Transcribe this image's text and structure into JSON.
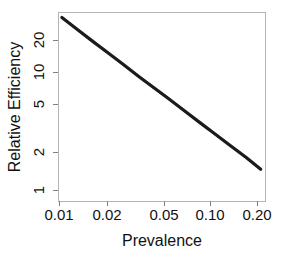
{
  "chart_data": {
    "type": "line",
    "title": "",
    "xlabel": "Prevalence",
    "ylabel": "Relative Efficiency",
    "xscale": "log",
    "yscale": "log",
    "xlim": [
      0.0095,
      0.215
    ],
    "ylim": [
      0.95,
      28
    ],
    "grid": false,
    "legend": "none",
    "xticks": [
      0.01,
      0.02,
      0.05,
      0.1,
      0.2
    ],
    "xticklabels": [
      "0.01",
      "0.02",
      "0.05",
      "0.10",
      "0.20"
    ],
    "yticks": [
      1,
      2,
      5,
      10,
      20
    ],
    "yticklabels": [
      "1",
      "2",
      "5",
      "10",
      "20"
    ],
    "series": [
      {
        "name": "Relative Efficiency",
        "color": "#1b1b1b",
        "x": [
          0.01,
          0.0125,
          0.016,
          0.02,
          0.025,
          0.032,
          0.04,
          0.05,
          0.063,
          0.08,
          0.1,
          0.125,
          0.16,
          0.2
        ],
        "y": [
          25.6,
          20.8,
          16.6,
          13.6,
          11.1,
          8.85,
          7.25,
          5.95,
          4.82,
          3.88,
          3.18,
          2.6,
          2.08,
          1.68
        ]
      }
    ],
    "annotations": []
  },
  "figure": {
    "background_color": "#ffffff",
    "axis_color": "#b4b4b4",
    "tick_color": "#808080",
    "text_color": "#111111",
    "line_color": "#1b1b1b"
  }
}
